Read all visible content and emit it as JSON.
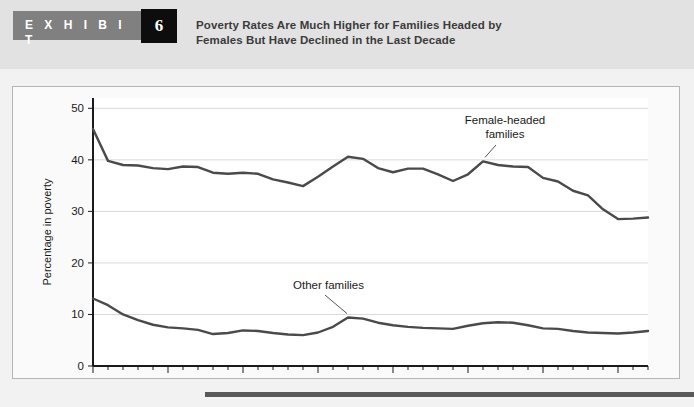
{
  "exhibit": {
    "label": "E X H I B I T",
    "number": "6",
    "title_line1": "Poverty Rates Are Much Higher for Families Headed by",
    "title_line2": "Females But Have Declined in the Last Decade"
  },
  "colors": {
    "header_band": "#e2e2e2",
    "exhibit_bar": "#808080",
    "exhibit_num_box": "#0d0d0d",
    "page_background": "#f2f2f2",
    "plot_background": "#ffffff",
    "line": "#4a4a4a",
    "gridline": "#d9d9d9",
    "axis": "#1a1a1a",
    "bottom_rule": "#595959"
  },
  "chart_data": {
    "type": "line",
    "title": "Poverty Rates Are Much Higher for Families Headed by Females But Have Declined in the Last Decade",
    "xlabel": "",
    "ylabel": "Percentage in poverty",
    "xlim": [
      1965,
      2002
    ],
    "ylim": [
      0,
      52
    ],
    "yticks": [
      0,
      10,
      20,
      30,
      40,
      50
    ],
    "ytick_labels": [
      "0",
      "10",
      "20",
      "30",
      "40",
      "50"
    ],
    "xticks": [
      1965,
      1970,
      1975,
      1980,
      1985,
      1990,
      1995,
      2000
    ],
    "xtick_labels": [
      "1965",
      "1970",
      "1975",
      "1980",
      "1985",
      "1990",
      "1995",
      "2000"
    ],
    "minor_xticks_every": 1,
    "grid": "horizontal",
    "legend": "annotations",
    "x": [
      1965,
      1966,
      1967,
      1968,
      1969,
      1970,
      1971,
      1972,
      1973,
      1974,
      1975,
      1976,
      1977,
      1978,
      1979,
      1980,
      1981,
      1982,
      1983,
      1984,
      1985,
      1986,
      1987,
      1988,
      1989,
      1990,
      1991,
      1992,
      1993,
      1994,
      1995,
      1996,
      1997,
      1998,
      1999,
      2000,
      2001,
      2002
    ],
    "series": [
      {
        "name": "Female-headed families",
        "annotation": "Female-headed families",
        "values": [
          46.0,
          39.8,
          39.0,
          38.9,
          38.4,
          38.2,
          38.7,
          38.6,
          37.5,
          37.3,
          37.5,
          37.3,
          36.2,
          35.6,
          34.9,
          36.7,
          38.7,
          40.6,
          40.2,
          38.4,
          37.6,
          38.3,
          38.3,
          37.2,
          35.9,
          37.2,
          39.7,
          39.0,
          38.7,
          38.6,
          36.5,
          35.8,
          34.0,
          33.1,
          30.4,
          28.5,
          28.6,
          28.8
        ]
      },
      {
        "name": "Other families",
        "annotation": "Other families",
        "values": [
          13.1,
          11.8,
          10.0,
          8.9,
          8.0,
          7.5,
          7.3,
          7.0,
          6.2,
          6.4,
          6.9,
          6.8,
          6.4,
          6.1,
          6.0,
          6.5,
          7.6,
          9.4,
          9.2,
          8.4,
          7.9,
          7.6,
          7.4,
          7.3,
          7.2,
          7.8,
          8.3,
          8.5,
          8.4,
          7.9,
          7.3,
          7.2,
          6.8,
          6.5,
          6.4,
          6.3,
          6.5,
          6.8
        ]
      }
    ],
    "annotations": [
      {
        "text_line1": "Female-headed",
        "text_line2": "families",
        "points_to_year": 1991
      },
      {
        "text_line1": "Other families",
        "text_line2": "",
        "points_to_year": 1982
      }
    ]
  }
}
